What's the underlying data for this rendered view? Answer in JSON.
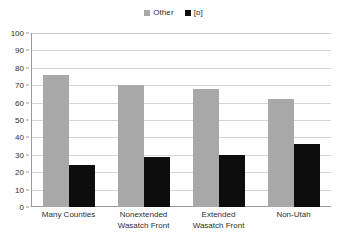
{
  "chart_data": {
    "type": "bar",
    "title": "",
    "subtitle": "",
    "xlabel": "",
    "ylabel": "",
    "ylim": [
      0,
      100
    ],
    "ytick_step": 10,
    "yticks": [
      100,
      90,
      80,
      70,
      60,
      50,
      40,
      30,
      20,
      10,
      0
    ],
    "grid": true,
    "legend_position": "top-center",
    "categories": [
      "Many Counties",
      "Nonextended\nWasatch Front",
      "Extended\nWasatch Front",
      "Non-Utah"
    ],
    "series": [
      {
        "name": "Other",
        "color": "#a8a8a8",
        "values": [
          76,
          70,
          68,
          62
        ]
      },
      {
        "name": "[ɒ]",
        "color": "#0d0d0d",
        "values": [
          24,
          29,
          30,
          36
        ]
      }
    ]
  },
  "legend": {
    "entries": [
      {
        "label": "Other",
        "swatch_color": "#a8a8a8",
        "icon": "legend-swatch-icon"
      },
      {
        "label": "[ɒ]",
        "swatch_color": "#0d0d0d",
        "icon": "legend-swatch-icon"
      }
    ]
  },
  "axes": {
    "y": {
      "ticks": [
        "100",
        "90",
        "80",
        "70",
        "60",
        "50",
        "40",
        "30",
        "20",
        "10",
        "0"
      ]
    },
    "x": {
      "ticks": [
        "Many Counties",
        "Nonextended\nWasatch Front",
        "Extended\nWasatch Front",
        "Non-Utah"
      ]
    }
  }
}
